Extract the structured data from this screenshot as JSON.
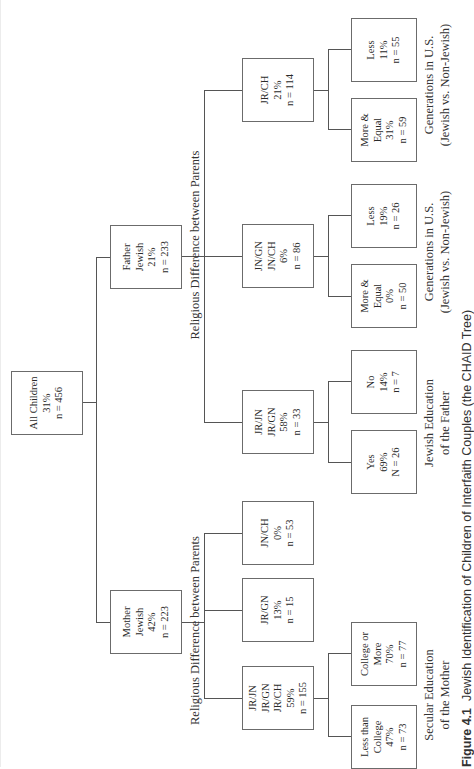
{
  "figure": {
    "caption_label": "Figure 4.1",
    "caption_text": "Jewish Identification of Children of Interfaith Couples (the CHAID Tree)"
  },
  "tree": {
    "root": {
      "lines": [
        "All Children",
        "31%",
        "n = 456"
      ]
    },
    "father": {
      "lines": [
        "Father",
        "Jewish",
        "21%",
        "n = 233"
      ]
    },
    "mother": {
      "lines": [
        "Mother",
        "Jewish",
        "42%",
        "n = 223"
      ]
    },
    "father_split_label": "Religious Difference between Parents",
    "mother_split_label": "Religious Difference between Parents",
    "father_children": [
      {
        "lines": [
          "JR/CH",
          "21%",
          "n = 114"
        ]
      },
      {
        "lines": [
          "JN/GN",
          "JN/CH",
          "6%",
          "n = 86"
        ]
      },
      {
        "lines": [
          "JR/JN",
          "JR/GN",
          "58%",
          "n = 33"
        ]
      }
    ],
    "mother_children": [
      {
        "lines": [
          "JN/CH",
          "0%",
          "n = 53"
        ]
      },
      {
        "lines": [
          "JR/GN",
          "13%",
          "n = 15"
        ]
      },
      {
        "lines": [
          "JR/JN",
          "JR/GN",
          "JR/CH",
          "59%",
          "n = 155"
        ]
      }
    ],
    "leaves": {
      "jrch": [
        {
          "lines": [
            "Less",
            "11%",
            "n = 55"
          ]
        },
        {
          "lines": [
            "More &",
            "Equal",
            "31%",
            "n = 59"
          ]
        }
      ],
      "jngn": [
        {
          "lines": [
            "Less",
            "19%",
            "n = 26"
          ]
        },
        {
          "lines": [
            "More &",
            "Equal",
            "0%",
            "n = 50"
          ]
        }
      ],
      "jrjn": [
        {
          "lines": [
            "No",
            "14%",
            "n = 7"
          ]
        },
        {
          "lines": [
            "Yes",
            "69%",
            "N = 26"
          ]
        }
      ],
      "mother_jrjn": [
        {
          "lines": [
            "College or",
            "More",
            "70%",
            "n = 77"
          ]
        },
        {
          "lines": [
            "Less than",
            "College",
            "47%",
            "n = 73"
          ]
        }
      ]
    },
    "leaf_labels": {
      "jrch": [
        "Generations in U.S.",
        "(Jewish vs. Non-Jewish)"
      ],
      "jngn": [
        "Generations in U.S.",
        "(Jewish vs. Non-Jewish)"
      ],
      "jrjn": [
        "Jewish Education",
        "of the Father"
      ],
      "mother_jrjn": [
        "Secular Education",
        "of the Mother"
      ]
    }
  }
}
